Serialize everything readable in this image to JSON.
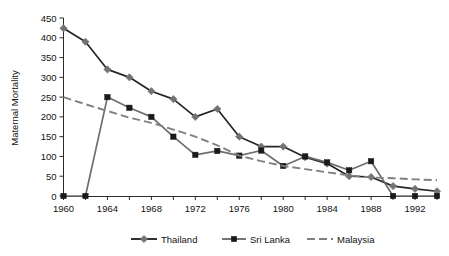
{
  "chart_data": {
    "type": "line",
    "title": "",
    "subtitle": "",
    "xlabel": "",
    "ylabel": "Maternal Mortality",
    "xlim": [
      1960,
      1994
    ],
    "ylim": [
      0,
      450
    ],
    "grid": false,
    "legend_position": "bottom",
    "x": [
      1960,
      1962,
      1964,
      1966,
      1968,
      1970,
      1972,
      1974,
      1976,
      1978,
      1980,
      1982,
      1984,
      1986,
      1988,
      1990,
      1992,
      1994
    ],
    "xticks_major": [
      1960,
      1964,
      1968,
      1972,
      1976,
      1980,
      1984,
      1988,
      1992
    ],
    "xtick_labels": [
      "1960",
      "1964",
      "1968",
      "1972",
      "1976",
      "1980",
      "1984",
      "1988",
      "1992"
    ],
    "xticks_minor": [
      1962,
      1966,
      1970,
      1974,
      1978,
      1982,
      1986,
      1990,
      1994
    ],
    "yticks": [
      0,
      50,
      100,
      150,
      200,
      250,
      300,
      350,
      400,
      450
    ],
    "ytick_labels": [
      "0",
      "50",
      "100",
      "150",
      "200",
      "250",
      "300",
      "350",
      "400",
      "450"
    ],
    "series": [
      {
        "name": "Thailand",
        "marker": "diamond",
        "line_style": "solid",
        "color": "#262626",
        "marker_color": "#737373",
        "values": [
          424,
          390,
          320,
          300,
          265,
          245,
          200,
          220,
          150,
          125,
          125,
          98,
          82,
          50,
          48,
          25,
          18,
          12
        ]
      },
      {
        "name": "Sri Lanka",
        "marker": "square",
        "line_style": "solid",
        "color": "#6e6e6e",
        "marker_color": "#1a1a1a",
        "values": [
          0,
          0,
          250,
          223,
          200,
          150,
          104,
          114,
          102,
          115,
          76,
          100,
          85,
          65,
          88,
          0,
          0,
          0
        ]
      },
      {
        "name": "Malaysia",
        "marker": "none",
        "line_style": "dashed",
        "color": "#808080",
        "marker_color": "#808080",
        "values": [
          250,
          232,
          215,
          198,
          185,
          168,
          150,
          128,
          102,
          88,
          76,
          68,
          60,
          52,
          47,
          45,
          42,
          40
        ]
      }
    ]
  },
  "axis": {
    "y_title": "Maternal Mortality"
  },
  "legend": {
    "items": [
      {
        "label": "Thailand"
      },
      {
        "label": "Sri Lanka"
      },
      {
        "label": "Malaysia"
      }
    ]
  }
}
